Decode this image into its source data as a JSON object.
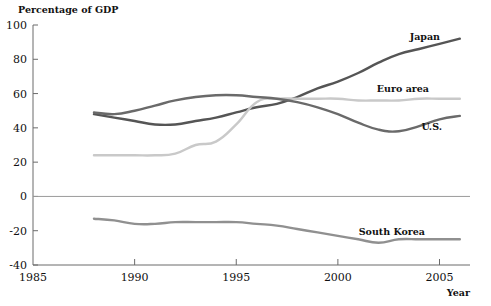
{
  "chart_data": {
    "type": "line",
    "title": "Percentage of GDP",
    "xlabel": "Year",
    "ylabel": "Percentage of GDP",
    "xlim": [
      1985,
      2006.5
    ],
    "ylim": [
      -40,
      100
    ],
    "xticks": [
      1985,
      1990,
      1995,
      2000,
      2005
    ],
    "xtick_labels": [
      "1985",
      "1990",
      "1995",
      "2000",
      "2005"
    ],
    "yticks": [
      -40,
      -20,
      0,
      20,
      40,
      60,
      80,
      100
    ],
    "ytick_labels": [
      "-40",
      "-20",
      "0",
      "20",
      "40",
      "60",
      "80",
      "100"
    ],
    "grid": false,
    "legend_position": "right-inline",
    "zero_line": 0,
    "series": [
      {
        "name": "Japan",
        "color": "#555555",
        "x": [
          1988,
          1989,
          1990,
          1991,
          1992,
          1993,
          1994,
          1995,
          1996,
          1997,
          1998,
          1999,
          2000,
          2001,
          2002,
          2003,
          2004,
          2005,
          2006
        ],
        "values": [
          48,
          46,
          44,
          42,
          42,
          44,
          46,
          49,
          52,
          54,
          58,
          63,
          67,
          72,
          78,
          83,
          86,
          89,
          92
        ]
      },
      {
        "name": "Euro area",
        "color": "#c9c9c9",
        "x": [
          1988,
          1989,
          1990,
          1991,
          1992,
          1993,
          1994,
          1995,
          1996,
          1997,
          1998,
          1999,
          2000,
          2001,
          2002,
          2003,
          2004,
          2005,
          2006
        ],
        "values": [
          24,
          24,
          24,
          24,
          25,
          30,
          32,
          42,
          55,
          57,
          57,
          57,
          57,
          56,
          56,
          56,
          57,
          57,
          57
        ]
      },
      {
        "name": "U.S.",
        "color": "#6a6a6a",
        "x": [
          1988,
          1989,
          1990,
          1991,
          1992,
          1993,
          1994,
          1995,
          1996,
          1997,
          1998,
          1999,
          2000,
          2001,
          2002,
          2003,
          2004,
          2005,
          2006
        ],
        "values": [
          49,
          48,
          50,
          53,
          56,
          58,
          59,
          59,
          58,
          57,
          55,
          52,
          48,
          43,
          39,
          38,
          41,
          45,
          47
        ]
      },
      {
        "name": "South Korea",
        "color": "#909090",
        "x": [
          1988,
          1989,
          1990,
          1991,
          1992,
          1993,
          1994,
          1995,
          1996,
          1997,
          1998,
          1999,
          2000,
          2001,
          2002,
          2003,
          2004,
          2005,
          2006
        ],
        "values": [
          -13,
          -14,
          -16,
          -16,
          -15,
          -15,
          -15,
          -15,
          -16,
          -17,
          -19,
          -21,
          -23,
          -25,
          -27,
          -25,
          -25,
          -25,
          -25
        ]
      }
    ],
    "series_label_positions": [
      {
        "name": "Japan",
        "x": 440,
        "y": 40
      },
      {
        "name": "Euro area",
        "x": 429,
        "y": 92
      },
      {
        "name": "U.S.",
        "x": 442,
        "y": 130
      },
      {
        "name": "South Korea",
        "x": 425,
        "y": 235
      }
    ]
  }
}
